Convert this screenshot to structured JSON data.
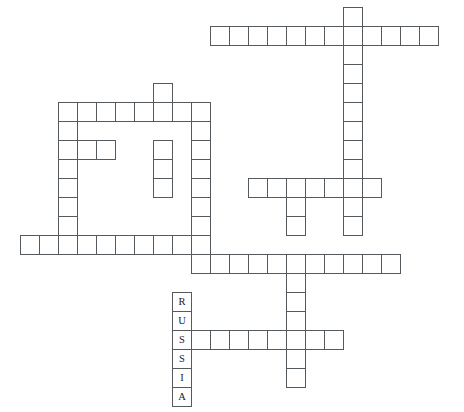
{
  "puzzle": {
    "title": "Crossword Puzzle Grid",
    "cell_size": 19,
    "grid_origin_x": 20,
    "grid_origin_y": 26,
    "background_color": "#ffffff",
    "cell_border_color": "#555a5e",
    "letter_color": "#1b1b1b",
    "filled_words": [
      {
        "text": "RUSSIA",
        "direction": "down",
        "start_col": 8,
        "start_row": 14,
        "length": 6
      }
    ],
    "entries": [
      {
        "name": "top-horizontal-row",
        "direction": "across",
        "row": 0,
        "col": 10,
        "length": 12,
        "letters": [
          "",
          "",
          "",
          "",
          "",
          "",
          "",
          "",
          "",
          "",
          "",
          ""
        ]
      },
      {
        "name": "long-vertical-right",
        "direction": "down",
        "row": 0,
        "col": 17,
        "length": 11,
        "letters": [
          "",
          "",
          "",
          "",
          "",
          "",
          "",
          "",
          "",
          "",
          ""
        ]
      },
      {
        "name": "short-vertical-upper-left",
        "direction": "down",
        "row": 3,
        "col": 7,
        "length": 7,
        "letters": [
          "",
          "",
          "",
          "",
          "",
          "",
          ""
        ]
      },
      {
        "name": "upper-left-horizontal-row",
        "direction": "across",
        "row": 4,
        "col": 2,
        "length": 8,
        "letters": [
          "",
          "",
          "",
          "",
          "",
          "",
          "",
          ""
        ]
      },
      {
        "name": "left-vertical-column",
        "direction": "down",
        "row": 4,
        "col": 2,
        "length": 7,
        "letters": [
          "",
          "",
          "",
          "",
          "",
          "",
          ""
        ]
      },
      {
        "name": "short-three-cell-row",
        "direction": "across",
        "row": 6,
        "col": 2,
        "length": 3,
        "letters": [
          "",
          "",
          ""
        ]
      },
      {
        "name": "middle-vertical-column",
        "direction": "down",
        "row": 4,
        "col": 9,
        "length": 9,
        "letters": [
          "",
          "",
          "",
          "",
          "",
          "",
          "",
          "",
          ""
        ]
      },
      {
        "name": "middle-right-horizontal-row",
        "direction": "across",
        "row": 8,
        "col": 12,
        "length": 7,
        "letters": [
          "",
          "",
          "",
          "",
          "",
          "",
          ""
        ]
      },
      {
        "name": "lower-left-long-row",
        "direction": "across",
        "row": 11,
        "col": 0,
        "length": 10,
        "letters": [
          "",
          "",
          "",
          "",
          "",
          "",
          "",
          "",
          "",
          ""
        ]
      },
      {
        "name": "lower-middle-long-row",
        "direction": "across",
        "row": 12,
        "col": 9,
        "length": 10,
        "letters": [
          "",
          "",
          "",
          "",
          "",
          "",
          "",
          "",
          "",
          ""
        ]
      },
      {
        "name": "bottom-vertical-column",
        "direction": "down",
        "row": 8,
        "col": 14,
        "length": 10,
        "letters": [
          "",
          "",
          "",
          "",
          "",
          "",
          "",
          "",
          "",
          ""
        ]
      },
      {
        "name": "russia-row",
        "direction": "across",
        "row": 16,
        "col": 8,
        "length": 9,
        "letters": [
          "S",
          "",
          "",
          "",
          "",
          "",
          "",
          "",
          ""
        ]
      }
    ],
    "cells": [
      {
        "name": "cell-r0c10",
        "col": 10,
        "row": 0,
        "letter": ""
      },
      {
        "name": "cell-r0c11",
        "col": 11,
        "row": 0,
        "letter": ""
      },
      {
        "name": "cell-r0c12",
        "col": 12,
        "row": 0,
        "letter": ""
      },
      {
        "name": "cell-r0c13",
        "col": 13,
        "row": 0,
        "letter": ""
      },
      {
        "name": "cell-r0c14",
        "col": 14,
        "row": 0,
        "letter": ""
      },
      {
        "name": "cell-r0c15",
        "col": 15,
        "row": 0,
        "letter": ""
      },
      {
        "name": "cell-r0c16",
        "col": 16,
        "row": 0,
        "letter": ""
      },
      {
        "name": "cell-r0c17",
        "col": 17,
        "row": 0,
        "letter": ""
      },
      {
        "name": "cell-r0c18",
        "col": 18,
        "row": 0,
        "letter": ""
      },
      {
        "name": "cell-r0c19",
        "col": 19,
        "row": 0,
        "letter": ""
      },
      {
        "name": "cell-r0c20",
        "col": 20,
        "row": 0,
        "letter": ""
      },
      {
        "name": "cell-r0c21",
        "col": 21,
        "row": 0,
        "letter": ""
      },
      {
        "name": "cell-rm1c17",
        "col": 17,
        "row": -1,
        "letter": ""
      },
      {
        "name": "cell-r1c17",
        "col": 17,
        "row": 1,
        "letter": ""
      },
      {
        "name": "cell-r2c17",
        "col": 17,
        "row": 2,
        "letter": ""
      },
      {
        "name": "cell-r3c17",
        "col": 17,
        "row": 3,
        "letter": ""
      },
      {
        "name": "cell-r4c17",
        "col": 17,
        "row": 4,
        "letter": ""
      },
      {
        "name": "cell-r5c17",
        "col": 17,
        "row": 5,
        "letter": ""
      },
      {
        "name": "cell-r6c17",
        "col": 17,
        "row": 6,
        "letter": ""
      },
      {
        "name": "cell-r7c17",
        "col": 17,
        "row": 7,
        "letter": ""
      },
      {
        "name": "cell-r8c17",
        "col": 17,
        "row": 8,
        "letter": ""
      },
      {
        "name": "cell-r9c17",
        "col": 17,
        "row": 9,
        "letter": ""
      },
      {
        "name": "cell-r10c17",
        "col": 17,
        "row": 10,
        "letter": ""
      },
      {
        "name": "cell-r3c7",
        "col": 7,
        "row": 3,
        "letter": ""
      },
      {
        "name": "cell-r4c2",
        "col": 2,
        "row": 4,
        "letter": ""
      },
      {
        "name": "cell-r4c3",
        "col": 3,
        "row": 4,
        "letter": ""
      },
      {
        "name": "cell-r4c4",
        "col": 4,
        "row": 4,
        "letter": ""
      },
      {
        "name": "cell-r4c5",
        "col": 5,
        "row": 4,
        "letter": ""
      },
      {
        "name": "cell-r4c6",
        "col": 6,
        "row": 4,
        "letter": ""
      },
      {
        "name": "cell-r4c7",
        "col": 7,
        "row": 4,
        "letter": ""
      },
      {
        "name": "cell-r4c8",
        "col": 8,
        "row": 4,
        "letter": ""
      },
      {
        "name": "cell-r4c9",
        "col": 9,
        "row": 4,
        "letter": ""
      },
      {
        "name": "cell-r5c2",
        "col": 2,
        "row": 5,
        "letter": ""
      },
      {
        "name": "cell-r5c9",
        "col": 9,
        "row": 5,
        "letter": ""
      },
      {
        "name": "cell-r6c2",
        "col": 2,
        "row": 6,
        "letter": ""
      },
      {
        "name": "cell-r6c3",
        "col": 3,
        "row": 6,
        "letter": ""
      },
      {
        "name": "cell-r6c4",
        "col": 4,
        "row": 6,
        "letter": ""
      },
      {
        "name": "cell-r6c7",
        "col": 7,
        "row": 6,
        "letter": ""
      },
      {
        "name": "cell-r6c9",
        "col": 9,
        "row": 6,
        "letter": ""
      },
      {
        "name": "cell-r7c2",
        "col": 2,
        "row": 7,
        "letter": ""
      },
      {
        "name": "cell-r7c7",
        "col": 7,
        "row": 7,
        "letter": ""
      },
      {
        "name": "cell-r7c9",
        "col": 9,
        "row": 7,
        "letter": ""
      },
      {
        "name": "cell-r8c2",
        "col": 2,
        "row": 8,
        "letter": ""
      },
      {
        "name": "cell-r8c7",
        "col": 7,
        "row": 8,
        "letter": ""
      },
      {
        "name": "cell-r8c9",
        "col": 9,
        "row": 8,
        "letter": ""
      },
      {
        "name": "cell-r8c12",
        "col": 12,
        "row": 8,
        "letter": ""
      },
      {
        "name": "cell-r8c13",
        "col": 13,
        "row": 8,
        "letter": ""
      },
      {
        "name": "cell-r8c14",
        "col": 14,
        "row": 8,
        "letter": ""
      },
      {
        "name": "cell-r8c15",
        "col": 15,
        "row": 8,
        "letter": ""
      },
      {
        "name": "cell-r8c16",
        "col": 16,
        "row": 8,
        "letter": ""
      },
      {
        "name": "cell-r8c18",
        "col": 18,
        "row": 8,
        "letter": ""
      },
      {
        "name": "cell-r9c2",
        "col": 2,
        "row": 9,
        "letter": ""
      },
      {
        "name": "cell-r9c9",
        "col": 9,
        "row": 9,
        "letter": ""
      },
      {
        "name": "cell-r9c14",
        "col": 14,
        "row": 9,
        "letter": ""
      },
      {
        "name": "cell-r10c2",
        "col": 2,
        "row": 10,
        "letter": ""
      },
      {
        "name": "cell-r10c9",
        "col": 9,
        "row": 10,
        "letter": ""
      },
      {
        "name": "cell-r10c14",
        "col": 14,
        "row": 10,
        "letter": ""
      },
      {
        "name": "cell-r11c0",
        "col": 0,
        "row": 11,
        "letter": ""
      },
      {
        "name": "cell-r11c1",
        "col": 1,
        "row": 11,
        "letter": ""
      },
      {
        "name": "cell-r11c2",
        "col": 2,
        "row": 11,
        "letter": ""
      },
      {
        "name": "cell-r11c3",
        "col": 3,
        "row": 11,
        "letter": ""
      },
      {
        "name": "cell-r11c4",
        "col": 4,
        "row": 11,
        "letter": ""
      },
      {
        "name": "cell-r11c5",
        "col": 5,
        "row": 11,
        "letter": ""
      },
      {
        "name": "cell-r11c6",
        "col": 6,
        "row": 11,
        "letter": ""
      },
      {
        "name": "cell-r11c7",
        "col": 7,
        "row": 11,
        "letter": ""
      },
      {
        "name": "cell-r11c8",
        "col": 8,
        "row": 11,
        "letter": ""
      },
      {
        "name": "cell-r11c9",
        "col": 9,
        "row": 11,
        "letter": ""
      },
      {
        "name": "cell-r12c9",
        "col": 9,
        "row": 12,
        "letter": ""
      },
      {
        "name": "cell-r12c10",
        "col": 10,
        "row": 12,
        "letter": ""
      },
      {
        "name": "cell-r12c11",
        "col": 11,
        "row": 12,
        "letter": ""
      },
      {
        "name": "cell-r12c12",
        "col": 12,
        "row": 12,
        "letter": ""
      },
      {
        "name": "cell-r12c13",
        "col": 13,
        "row": 12,
        "letter": ""
      },
      {
        "name": "cell-r12c14",
        "col": 14,
        "row": 12,
        "letter": ""
      },
      {
        "name": "cell-r12c15",
        "col": 15,
        "row": 12,
        "letter": ""
      },
      {
        "name": "cell-r12c16",
        "col": 16,
        "row": 12,
        "letter": ""
      },
      {
        "name": "cell-r12c17",
        "col": 17,
        "row": 12,
        "letter": ""
      },
      {
        "name": "cell-r12c18",
        "col": 18,
        "row": 12,
        "letter": ""
      },
      {
        "name": "cell-r12c19",
        "col": 19,
        "row": 12,
        "letter": ""
      },
      {
        "name": "cell-r13c14",
        "col": 14,
        "row": 13,
        "letter": ""
      },
      {
        "name": "cell-r14c8",
        "col": 8,
        "row": 14,
        "letter": "R"
      },
      {
        "name": "cell-r14c14",
        "col": 14,
        "row": 14,
        "letter": ""
      },
      {
        "name": "cell-r15c8",
        "col": 8,
        "row": 15,
        "letter": "U"
      },
      {
        "name": "cell-r15c14",
        "col": 14,
        "row": 15,
        "letter": ""
      },
      {
        "name": "cell-r16c8",
        "col": 8,
        "row": 16,
        "letter": "S"
      },
      {
        "name": "cell-r16c9",
        "col": 9,
        "row": 16,
        "letter": ""
      },
      {
        "name": "cell-r16c10",
        "col": 10,
        "row": 16,
        "letter": ""
      },
      {
        "name": "cell-r16c11",
        "col": 11,
        "row": 16,
        "letter": ""
      },
      {
        "name": "cell-r16c12",
        "col": 12,
        "row": 16,
        "letter": ""
      },
      {
        "name": "cell-r16c13",
        "col": 13,
        "row": 16,
        "letter": ""
      },
      {
        "name": "cell-r16c14",
        "col": 14,
        "row": 16,
        "letter": ""
      },
      {
        "name": "cell-r16c15",
        "col": 15,
        "row": 16,
        "letter": ""
      },
      {
        "name": "cell-r16c16",
        "col": 16,
        "row": 16,
        "letter": ""
      },
      {
        "name": "cell-r17c8",
        "col": 8,
        "row": 17,
        "letter": "S"
      },
      {
        "name": "cell-r17c14",
        "col": 14,
        "row": 17,
        "letter": ""
      },
      {
        "name": "cell-r18c8",
        "col": 8,
        "row": 18,
        "letter": "I"
      },
      {
        "name": "cell-r18c14",
        "col": 14,
        "row": 18,
        "letter": ""
      },
      {
        "name": "cell-r19c8",
        "col": 8,
        "row": 19,
        "letter": "A"
      }
    ]
  }
}
